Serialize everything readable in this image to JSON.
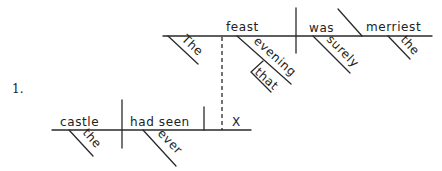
{
  "exercise": {
    "number": "1."
  },
  "main_clause": {
    "subject": "feast",
    "subject_modifiers": [
      "The"
    ],
    "verb": "was",
    "verb_modifiers": [
      "surely"
    ],
    "predicate_adjective": "merriest",
    "predicate_adjective_modifiers": [
      "the"
    ],
    "relative_modifier": {
      "word": "evening",
      "modifier": "that"
    }
  },
  "subordinate_clause": {
    "subject": "castle",
    "subject_modifiers": [
      "the"
    ],
    "verb": "had seen",
    "verb_modifiers": [
      "ever"
    ],
    "object": "X"
  },
  "colors": {
    "ink": "#2a2a2a",
    "background": "#ffffff"
  }
}
